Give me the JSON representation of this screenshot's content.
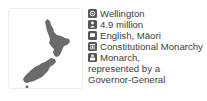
{
  "map": {
    "country": "New Zealand",
    "fill_color": "#6b6b6b",
    "border_color": "#ececec"
  },
  "facts": [
    {
      "icon": "capital-icon",
      "label": "Wellington"
    },
    {
      "icon": "population-icon",
      "label": "4.9 million"
    },
    {
      "icon": "language-icon",
      "label": "English, Māori"
    },
    {
      "icon": "government-icon",
      "label": "Constitutional Monarchy"
    },
    {
      "icon": "head-of-state-icon",
      "label": "Monarch,",
      "continuation": [
        "represented by a",
        "Governor-General"
      ]
    }
  ]
}
